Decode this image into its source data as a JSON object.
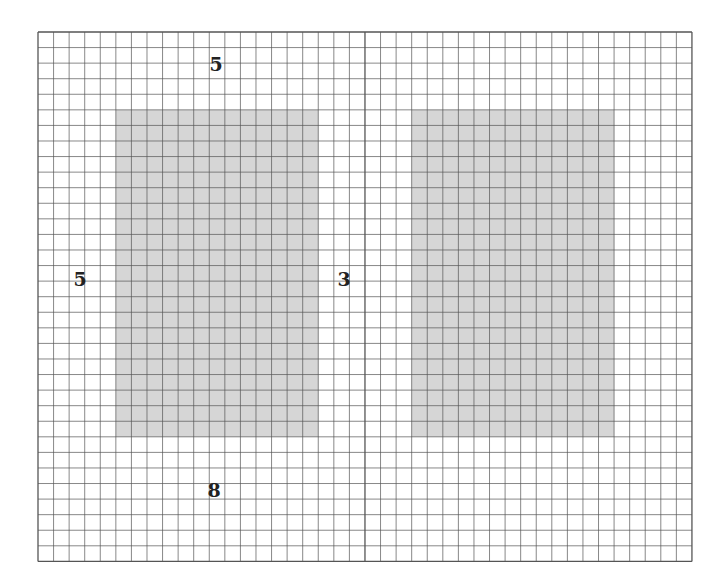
{
  "grid": {
    "x0": 38,
    "y0": 32,
    "cols": 42,
    "rows": 34,
    "cell": 15.57,
    "line_color": "#555555",
    "divider_col": 21
  },
  "shapes": [
    {
      "name": "left-rectangle",
      "col": 5,
      "row": 5,
      "w": 13,
      "h": 21,
      "fill": "#d6d6d6"
    },
    {
      "name": "right-rectangle",
      "col": 24,
      "row": 5,
      "w": 13,
      "h": 21,
      "fill": "#d6d6d6"
    }
  ],
  "labels": {
    "top": "5",
    "left": "5",
    "gap": "3",
    "bottom": "8"
  }
}
